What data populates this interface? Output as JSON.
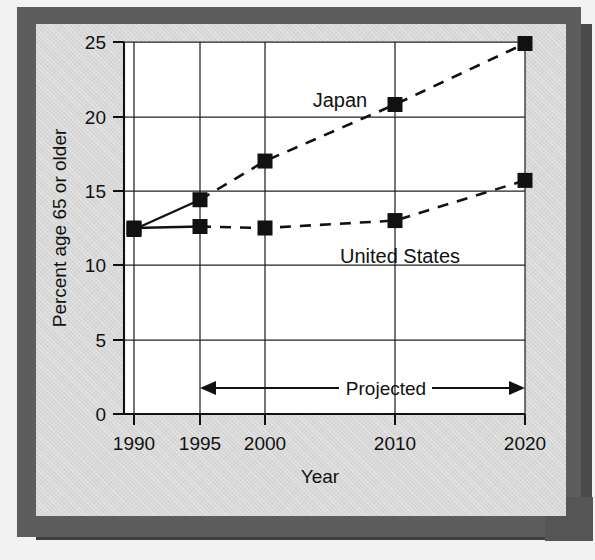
{
  "figure": {
    "background_color": "#d8d8d8",
    "frame_color": "#5d5d5d",
    "plot_background_color": "#ffffff",
    "ink_color": "#111111"
  },
  "chart_data": {
    "type": "line",
    "title": "",
    "xlabel": "Year",
    "ylabel": "Percent age 65 or older",
    "categories": [
      "1990",
      "1995",
      "2000",
      "2010",
      "2020"
    ],
    "x": [
      1990,
      1995,
      2000,
      2010,
      2020
    ],
    "xtick_labels": [
      "1990",
      "1995",
      "2000",
      "2010",
      "2020"
    ],
    "ytick_labels": [
      "0",
      "5",
      "10",
      "15",
      "20",
      "25"
    ],
    "yticks": [
      0,
      5,
      10,
      15,
      20,
      25
    ],
    "ylim": [
      0,
      25
    ],
    "grid": "horizontal-and-vertical",
    "legend": "inline-labels",
    "series": [
      {
        "name": "Japan",
        "values": [
          12.4,
          14.4,
          17.0,
          20.8,
          24.9
        ],
        "marker": "square",
        "solid_through": "1995",
        "dashed_from": "1995",
        "label_x_value": 2000,
        "label_y_value": 21.5
      },
      {
        "name": "United States",
        "values": [
          12.5,
          12.6,
          12.5,
          13.0,
          15.7
        ],
        "marker": "square",
        "solid_through": "1995",
        "dashed_from": "1995",
        "label_x_value": 2009,
        "label_y_value": 11.3
      }
    ],
    "annotations": [
      {
        "text": "Projected",
        "type": "double-headed-arrow",
        "from_x": 1995,
        "to_x": 2020,
        "y_value": 2.4
      }
    ]
  },
  "axis": {
    "y_title": "Percent age 65 or older",
    "x_title": "Year",
    "y_ticks": [
      "25",
      "20",
      "15",
      "10",
      "5",
      "0"
    ],
    "x_ticks": [
      "1990",
      "1995",
      "2000",
      "2010",
      "2020"
    ]
  },
  "labels": {
    "japan": "Japan",
    "united_states": "United States",
    "projected": "Projected"
  }
}
